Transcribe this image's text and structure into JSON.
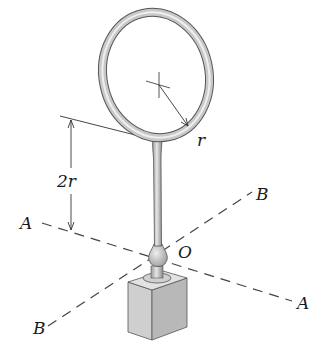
{
  "figure": {
    "type": "engineering-mechanics-diagram",
    "labels": {
      "radius": "r",
      "height_dimension": "2r",
      "origin": "O",
      "axis_a_left": "A",
      "axis_a_right": "A",
      "axis_b_top": "B",
      "axis_b_bottom": "B"
    },
    "colors": {
      "line": "#333333",
      "ring_outer": "#555555",
      "ring_fill": "#c8c8c8",
      "ring_highlight": "#eeeeee",
      "block_front": "#cfcfcf",
      "block_side": "#b5b5b5",
      "block_top": "#e2e2e2",
      "post_fill": "#c4c4c4"
    }
  }
}
